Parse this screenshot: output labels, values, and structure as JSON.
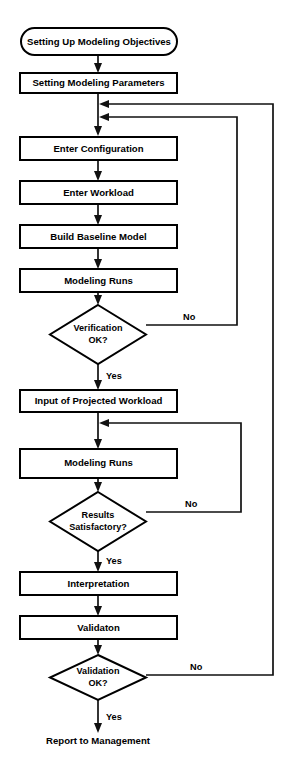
{
  "diagram": {
    "type": "flowchart",
    "background_color": "#ffffff",
    "line_color": "#111111",
    "text_color": "#000000",
    "nodes": [
      {
        "id": "start",
        "shape": "rounded-terminator",
        "label": "Setting Up Modeling Objectives"
      },
      {
        "id": "params",
        "shape": "process",
        "label": "Setting Modeling Parameters"
      },
      {
        "id": "config",
        "shape": "process",
        "label": "Enter Configuration"
      },
      {
        "id": "workload",
        "shape": "process",
        "label": "Enter Workload"
      },
      {
        "id": "baseline",
        "shape": "process",
        "label": "Build Baseline Model"
      },
      {
        "id": "runs1",
        "shape": "process",
        "label": "Modeling Runs"
      },
      {
        "id": "verify",
        "shape": "decision",
        "label_line1": "Verification",
        "label_line2": "OK?"
      },
      {
        "id": "projected",
        "shape": "process",
        "label": "Input of Projected Workload"
      },
      {
        "id": "runs2",
        "shape": "process",
        "label": "Modeling Runs"
      },
      {
        "id": "results",
        "shape": "decision",
        "label_line1": "Results",
        "label_line2": "Satisfactory?"
      },
      {
        "id": "interpret",
        "shape": "process",
        "label": "Interpretation"
      },
      {
        "id": "validaton",
        "shape": "process",
        "label": "Validaton"
      },
      {
        "id": "validation",
        "shape": "decision",
        "label_line1": "Validation",
        "label_line2": "OK?"
      },
      {
        "id": "report",
        "shape": "plain-text",
        "label": "Report to Management"
      }
    ],
    "edge_labels": {
      "verify_no": "No",
      "verify_yes": "Yes",
      "results_no": "No",
      "results_yes": "Yes",
      "validation_no": "No",
      "validation_yes": "Yes"
    },
    "edges": [
      {
        "from": "start",
        "to": "params",
        "label": ""
      },
      {
        "from": "params",
        "to": "config",
        "label": ""
      },
      {
        "from": "config",
        "to": "workload",
        "label": ""
      },
      {
        "from": "workload",
        "to": "baseline",
        "label": ""
      },
      {
        "from": "baseline",
        "to": "runs1",
        "label": ""
      },
      {
        "from": "runs1",
        "to": "verify",
        "label": ""
      },
      {
        "from": "verify",
        "to": "projected",
        "label": "Yes"
      },
      {
        "from": "verify",
        "to": "config",
        "label": "No"
      },
      {
        "from": "projected",
        "to": "runs2",
        "label": ""
      },
      {
        "from": "runs2",
        "to": "results",
        "label": ""
      },
      {
        "from": "results",
        "to": "interpret",
        "label": "Yes"
      },
      {
        "from": "results",
        "to": "runs2",
        "label": "No"
      },
      {
        "from": "interpret",
        "to": "validaton",
        "label": ""
      },
      {
        "from": "validaton",
        "to": "validation",
        "label": ""
      },
      {
        "from": "validation",
        "to": "report",
        "label": "Yes"
      },
      {
        "from": "validation",
        "to": "config",
        "label": "No"
      }
    ]
  }
}
